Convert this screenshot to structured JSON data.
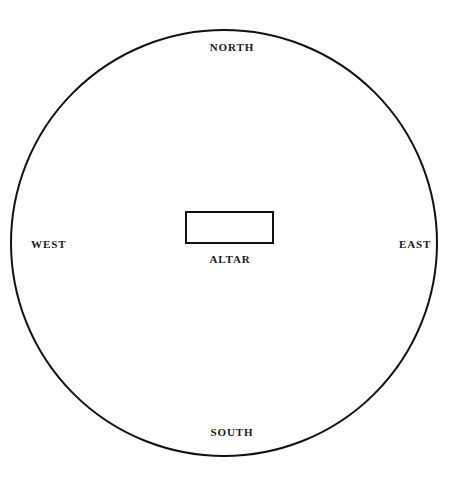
{
  "diagram": {
    "type": "schematic-plan",
    "background_color": "#ffffff",
    "stroke_color": "#111111",
    "text_color": "#1a1a1a",
    "circle": {
      "name": "ritual-circle",
      "center_x": 224,
      "center_y": 243,
      "radius": 213,
      "stroke_width": 2,
      "fill": "none"
    },
    "altar": {
      "name": "altar-rectangle",
      "x": 186,
      "y": 212,
      "width": 87,
      "height": 31,
      "stroke_width": 2,
      "fill": "none",
      "label": "ALTAR"
    },
    "cardinal_labels": [
      {
        "id": "north",
        "text": "NORTH",
        "position": "top"
      },
      {
        "id": "east",
        "text": "EAST",
        "position": "right"
      },
      {
        "id": "south",
        "text": "SOUTH",
        "position": "bottom"
      },
      {
        "id": "west",
        "text": "WEST",
        "position": "left"
      }
    ]
  }
}
